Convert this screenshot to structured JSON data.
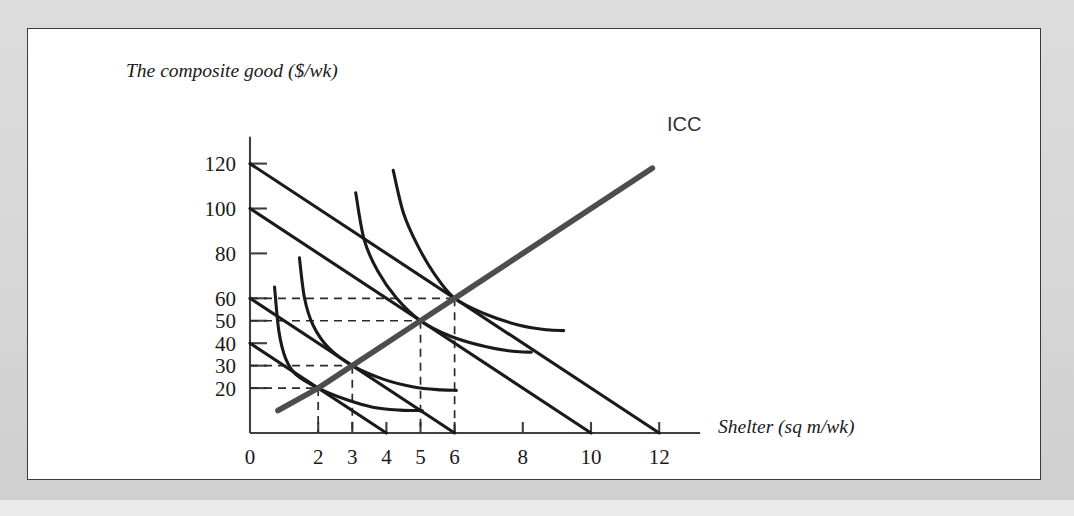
{
  "figure": {
    "background_color": "#d9d9d9",
    "card_color": "#ffffff",
    "card_border_color": "#3a3a3a"
  },
  "chart_data": {
    "type": "line",
    "title": "",
    "xlabel": "Shelter (sq m/wk)",
    "ylabel": "The composite good ($/wk)",
    "xlim": [
      0,
      13.2
    ],
    "ylim": [
      0,
      132
    ],
    "grid": false,
    "legend_position": "inline-label",
    "x_ticks": [
      0,
      2,
      3,
      4,
      5,
      6,
      8,
      10,
      12
    ],
    "x_tick_labels": [
      "0",
      "2",
      "3",
      "4",
      "5",
      "6",
      "8",
      "10",
      "12"
    ],
    "y_ticks": [
      20,
      30,
      40,
      50,
      60,
      80,
      100,
      120
    ],
    "y_tick_labels": [
      "20",
      "30",
      "40",
      "50",
      "60",
      "80",
      "100",
      "120"
    ],
    "series": [
      {
        "name": "Budget line 1",
        "type": "budget-line",
        "color": "#1a1a1a",
        "y_intercept": 40,
        "x_intercept": 4,
        "slope": -10,
        "points": [
          [
            0,
            40
          ],
          [
            4,
            0
          ]
        ]
      },
      {
        "name": "Budget line 2",
        "type": "budget-line",
        "color": "#1a1a1a",
        "y_intercept": 60,
        "x_intercept": 6,
        "slope": -10,
        "points": [
          [
            0,
            60
          ],
          [
            6,
            0
          ]
        ]
      },
      {
        "name": "Budget line 3",
        "type": "budget-line",
        "color": "#1a1a1a",
        "y_intercept": 100,
        "x_intercept": 10,
        "slope": -10,
        "points": [
          [
            0,
            100
          ],
          [
            10,
            0
          ]
        ]
      },
      {
        "name": "Budget line 4",
        "type": "budget-line",
        "color": "#1a1a1a",
        "y_intercept": 120,
        "x_intercept": 12,
        "slope": -10,
        "points": [
          [
            0,
            120
          ],
          [
            12,
            0
          ]
        ]
      },
      {
        "name": "Indifference curve 1",
        "type": "indifference-curve",
        "color": "#1a1a1a",
        "tangency": [
          2,
          20
        ],
        "points": [
          [
            0.72,
            65
          ],
          [
            0.85,
            45
          ],
          [
            1.05,
            33
          ],
          [
            1.35,
            26
          ],
          [
            2.0,
            20
          ],
          [
            2.8,
            15
          ],
          [
            3.6,
            11.5
          ],
          [
            4.4,
            10.2
          ],
          [
            5.05,
            10.0
          ]
        ]
      },
      {
        "name": "Indifference curve 2",
        "type": "indifference-curve",
        "color": "#1a1a1a",
        "tangency": [
          3,
          30
        ],
        "points": [
          [
            1.45,
            78
          ],
          [
            1.6,
            60
          ],
          [
            1.85,
            48
          ],
          [
            2.3,
            38
          ],
          [
            3.0,
            30
          ],
          [
            3.9,
            24
          ],
          [
            4.8,
            20.5
          ],
          [
            5.6,
            19.2
          ],
          [
            6.05,
            19.0
          ]
        ]
      },
      {
        "name": "Indifference curve 3",
        "type": "indifference-curve",
        "color": "#1a1a1a",
        "tangency": [
          5,
          50
        ],
        "points": [
          [
            3.1,
            107
          ],
          [
            3.35,
            86
          ],
          [
            3.75,
            72
          ],
          [
            4.3,
            60
          ],
          [
            5.0,
            50
          ],
          [
            5.9,
            43
          ],
          [
            6.9,
            38.5
          ],
          [
            7.7,
            36.4
          ],
          [
            8.25,
            36.0
          ]
        ]
      },
      {
        "name": "Indifference curve 4",
        "type": "indifference-curve",
        "color": "#1a1a1a",
        "tangency": [
          6,
          60
        ],
        "points": [
          [
            4.2,
            117
          ],
          [
            4.5,
            98
          ],
          [
            4.9,
            84
          ],
          [
            5.4,
            71
          ],
          [
            6.0,
            60
          ],
          [
            6.9,
            53
          ],
          [
            7.9,
            48
          ],
          [
            8.7,
            46.0
          ],
          [
            9.2,
            45.6
          ]
        ]
      },
      {
        "name": "ICC",
        "type": "income-consumption-curve",
        "color": "#4d4d4d",
        "label": "ICC",
        "points": [
          [
            0.82,
            10
          ],
          [
            2,
            20
          ],
          [
            3,
            30
          ],
          [
            5,
            50
          ],
          [
            6,
            60
          ],
          [
            11.8,
            118
          ]
        ]
      }
    ],
    "tangency_points": [
      {
        "x": 2,
        "y": 20
      },
      {
        "x": 3,
        "y": 30
      },
      {
        "x": 5,
        "y": 50
      },
      {
        "x": 6,
        "y": 60
      }
    ],
    "annotations": [
      {
        "text": "ICC",
        "x": 12.1,
        "y": 120
      }
    ]
  }
}
